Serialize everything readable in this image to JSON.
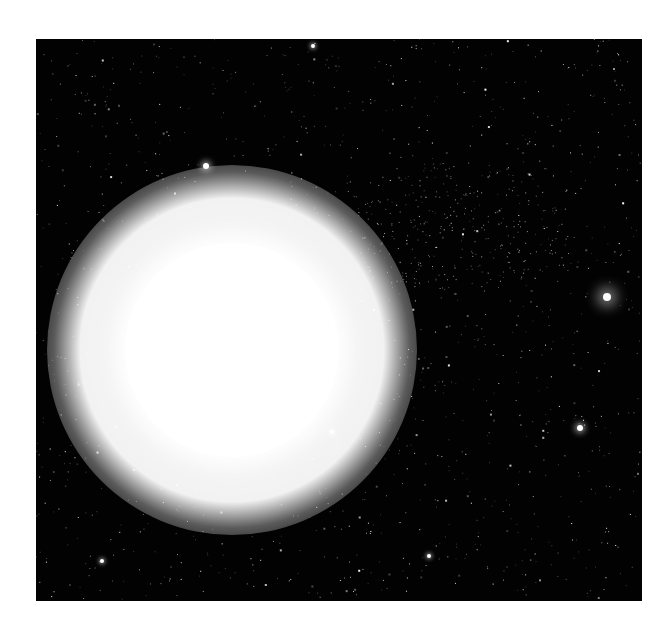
{
  "scene": {
    "description": "Bright sun-like star against a dense starfield",
    "background_color": "#020202",
    "page_color": "#ffffff",
    "frame": {
      "x": 36,
      "y": 39,
      "width": 606,
      "height": 562
    }
  },
  "sun": {
    "cx": 196,
    "cy": 311,
    "disk_radius": 107,
    "glow_radius": 185,
    "color": "#ffffff"
  },
  "bright_stars": [
    {
      "name": "star-upper-left",
      "cx": 170,
      "cy": 127,
      "r": 3,
      "glow": 6
    },
    {
      "name": "star-right-glowing",
      "cx": 571,
      "cy": 258,
      "r": 4,
      "glow": 14
    },
    {
      "name": "star-lower-right",
      "cx": 544,
      "cy": 389,
      "r": 3,
      "glow": 6
    },
    {
      "name": "star-near-sun",
      "cx": 296,
      "cy": 393,
      "r": 2,
      "glow": 5
    },
    {
      "name": "star-top-center",
      "cx": 277,
      "cy": 7,
      "r": 2,
      "glow": 4
    },
    {
      "name": "star-bottom-left",
      "cx": 66,
      "cy": 522,
      "r": 2,
      "glow": 4
    },
    {
      "name": "star-bottom-center",
      "cx": 393,
      "cy": 517,
      "r": 2,
      "glow": 4
    }
  ],
  "starfield": {
    "seed": 7,
    "count": 1400,
    "cluster": {
      "cx": 420,
      "cy": 190,
      "rx": 120,
      "ry": 70,
      "extra": 260
    }
  }
}
